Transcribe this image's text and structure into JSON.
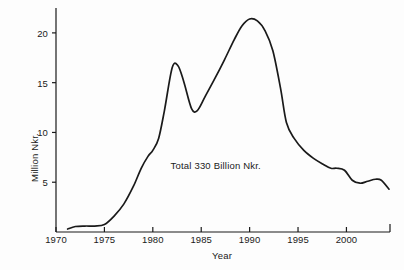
{
  "chart_data": {
    "type": "line",
    "title": "",
    "subtitle": "",
    "xlabel": "Year",
    "ylabel": "Million Nkr.",
    "xlim": [
      1970,
      2004.5
    ],
    "ylim": [
      0,
      22.5
    ],
    "grid": false,
    "legend": "none",
    "annotations": [
      {
        "text": "Total 330 Billion Nkr.",
        "x": 1986.5,
        "y": 6.6
      }
    ],
    "xticks": [
      1970,
      1975,
      1980,
      1985,
      1990,
      1995,
      2000
    ],
    "xtick_labels": [
      "1970",
      "1975",
      "1980",
      "1985",
      "1990",
      "1995",
      "2000"
    ],
    "yticks": [
      5,
      10,
      15,
      20
    ],
    "ytick_labels": [
      "5",
      "10",
      "15",
      "20"
    ],
    "series": [
      {
        "name": "Annual value",
        "color": "#1a1a1a",
        "x": [
          1971.2,
          1972,
          1973,
          1974,
          1975,
          1976,
          1977,
          1978,
          1978.8,
          1979.5,
          1980,
          1980.6,
          1981.2,
          1982,
          1982.6,
          1983.2,
          1984,
          1984.6,
          1985.4,
          1986.4,
          1987.4,
          1988.4,
          1989.2,
          1990,
          1990.8,
          1991.6,
          1992.4,
          1993.2,
          1993.8,
          1994.6,
          1995.6,
          1996.6,
          1997.6,
          1998.4,
          1999,
          1999.8,
          2000.6,
          2001.4,
          2002.2,
          2003,
          2003.6,
          2004.4
        ],
        "y": [
          0.3,
          0.55,
          0.6,
          0.6,
          0.75,
          1.6,
          2.8,
          4.6,
          6.4,
          7.6,
          8.2,
          9.4,
          12.2,
          16.5,
          16.7,
          15.1,
          12.4,
          12.2,
          13.6,
          15.4,
          17.3,
          19.3,
          20.7,
          21.4,
          21.2,
          20.2,
          18.2,
          14.4,
          11.0,
          9.4,
          8.2,
          7.4,
          6.8,
          6.4,
          6.4,
          6.2,
          5.2,
          4.9,
          5.1,
          5.3,
          5.2,
          4.3
        ]
      }
    ]
  },
  "axis": {
    "x_title": "Year",
    "y_title": "Million Nkr."
  },
  "colors": {
    "line": "#1a1a1a",
    "axis": "#1a1a1a",
    "background": "#fdfdfd"
  }
}
